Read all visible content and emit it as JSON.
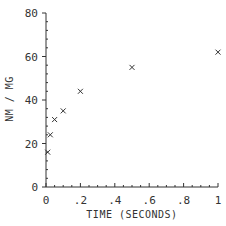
{
  "chart_data": {
    "type": "scatter",
    "title": "",
    "xlabel": "TIME (SECONDS)",
    "ylabel": "NM / MG",
    "xlim": [
      0,
      1
    ],
    "ylim": [
      0,
      80
    ],
    "x_ticks": [
      0,
      0.2,
      0.4,
      0.6,
      0.8,
      1
    ],
    "x_tick_labels": [
      "0",
      ".2",
      ".4",
      ".6",
      ".8",
      "1"
    ],
    "y_ticks": [
      0,
      20,
      40,
      60,
      80
    ],
    "y_tick_labels": [
      "0",
      "20",
      "40",
      "60",
      "80"
    ],
    "grid": false,
    "marker": "x",
    "series": [
      {
        "name": "data",
        "x": [
          0.01,
          0.025,
          0.05,
          0.1,
          0.2,
          0.5,
          1.0
        ],
        "y": [
          16,
          24,
          31,
          35,
          44,
          55,
          62
        ]
      }
    ]
  },
  "colors": {
    "axis": "#333333",
    "marker": "#333333"
  }
}
